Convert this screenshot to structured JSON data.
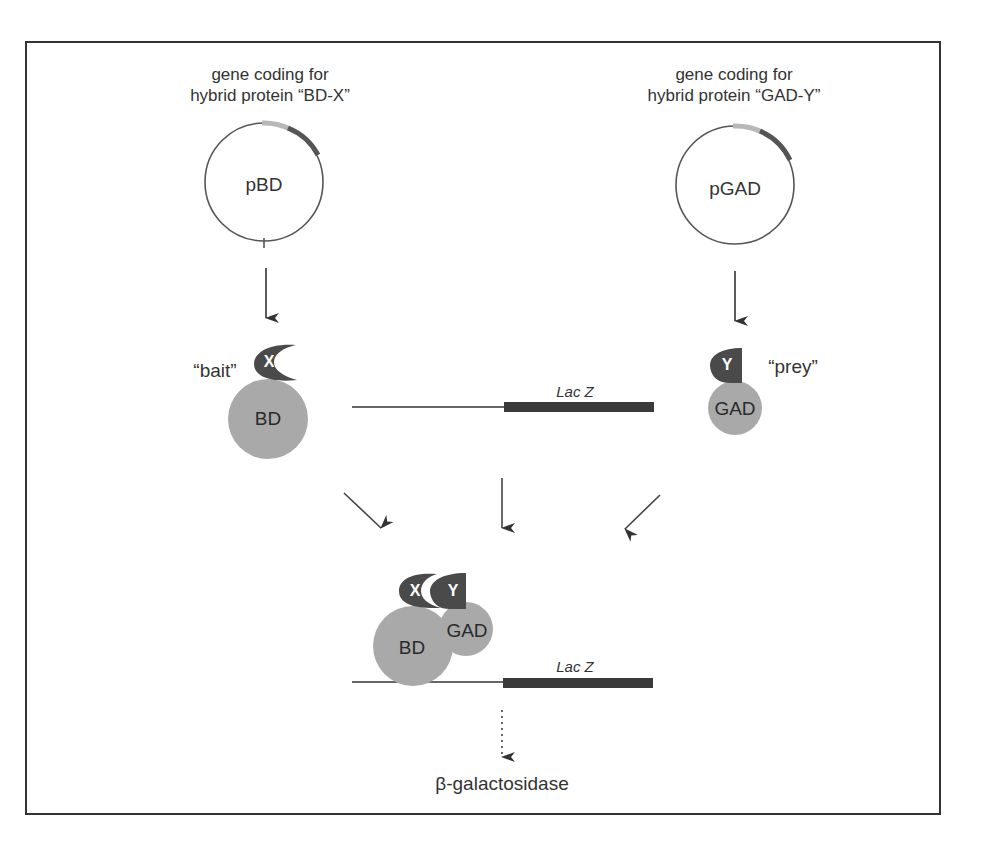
{
  "figure": {
    "top_cut_text": "…g… … (… , … )",
    "left_plasmid": {
      "caption_line1": "gene coding for",
      "caption_line2": "hybrid protein “BD-X”",
      "name": "pBD"
    },
    "right_plasmid": {
      "caption_line1": "gene coding for",
      "caption_line2": "hybrid protein “GAD-Y”",
      "name": "pGAD"
    },
    "bait": {
      "role_label": "“bait”",
      "domain_letter": "X",
      "protein_label": "BD"
    },
    "prey": {
      "role_label": "“prey”",
      "domain_letter": "Y",
      "protein_label": "GAD"
    },
    "reporter_top": {
      "gene_label": "Lac Z"
    },
    "complex": {
      "x_letter": "X",
      "y_letter": "Y",
      "bd_label": "BD",
      "gad_label": "GAD"
    },
    "reporter_bottom": {
      "gene_label": "Lac Z"
    },
    "product": {
      "label": "β-galactosidase"
    },
    "colors": {
      "protein_fill": "#a9a9a9",
      "domain_fill": "#4a4a4a",
      "gene_bar": "#3a3a3a",
      "plasmid_light_segment": "#b8b8b8",
      "plasmid_dark_segment": "#555555",
      "line": "#555555"
    }
  }
}
